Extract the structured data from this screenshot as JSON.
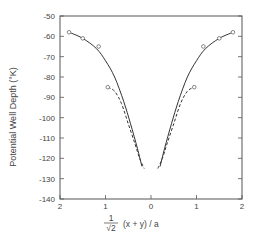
{
  "chart_data": {
    "type": "line",
    "title": "",
    "xlabel": "(1/√2) (x + y) / a",
    "xlabel_parts": {
      "frac_num": "1",
      "frac_den": "√2",
      "rest": "(x + y) / a"
    },
    "ylabel": "Potential Well Depth  (°K)",
    "xlim": [
      -2,
      2
    ],
    "ylim": [
      -140,
      -50
    ],
    "x_tick_values": [
      -2,
      -1,
      0,
      1,
      2
    ],
    "x_tick_labels": [
      "2",
      "1",
      "0",
      "1",
      "2"
    ],
    "y_tick_values": [
      -50,
      -60,
      -70,
      -80,
      -90,
      -100,
      -110,
      -120,
      -130,
      -140
    ],
    "y_tick_labels": [
      "-50",
      "-60",
      "-70",
      "-80",
      "-90",
      "-100",
      "-110",
      "-120",
      "-130",
      "-140"
    ],
    "grid": false,
    "legend": null,
    "series": [
      {
        "name": "solid curve",
        "style": "solid",
        "points_left": [
          [
            -1.8,
            -58
          ],
          [
            -1.5,
            -61
          ],
          [
            -1.2,
            -66
          ],
          [
            -1.0,
            -72
          ],
          [
            -0.8,
            -80
          ],
          [
            -0.6,
            -92
          ],
          [
            -0.45,
            -103
          ],
          [
            -0.3,
            -115
          ],
          [
            -0.2,
            -124
          ]
        ],
        "points_right": [
          [
            0.2,
            -124
          ],
          [
            0.3,
            -115
          ],
          [
            0.45,
            -103
          ],
          [
            0.6,
            -92
          ],
          [
            0.8,
            -80
          ],
          [
            1.0,
            -72
          ],
          [
            1.2,
            -66
          ],
          [
            1.5,
            -61
          ],
          [
            1.8,
            -58
          ]
        ]
      },
      {
        "name": "dashed curve",
        "style": "dashed",
        "points_left": [
          [
            -0.95,
            -85
          ],
          [
            -0.8,
            -87
          ],
          [
            -0.65,
            -93
          ],
          [
            -0.5,
            -103
          ],
          [
            -0.35,
            -113
          ],
          [
            -0.25,
            -120
          ],
          [
            -0.15,
            -125
          ]
        ],
        "points_right": [
          [
            0.15,
            -125
          ],
          [
            0.25,
            -120
          ],
          [
            0.35,
            -113
          ],
          [
            0.5,
            -103
          ],
          [
            0.65,
            -93
          ],
          [
            0.8,
            -87
          ],
          [
            0.95,
            -85
          ]
        ]
      },
      {
        "name": "open-circle markers",
        "style": "markers",
        "points": [
          [
            -1.8,
            -58
          ],
          [
            -1.5,
            -61
          ],
          [
            -1.15,
            -65
          ],
          [
            -0.95,
            -85
          ],
          [
            0.95,
            -85
          ],
          [
            1.15,
            -65
          ],
          [
            1.5,
            -61
          ],
          [
            1.8,
            -58
          ]
        ]
      }
    ]
  }
}
